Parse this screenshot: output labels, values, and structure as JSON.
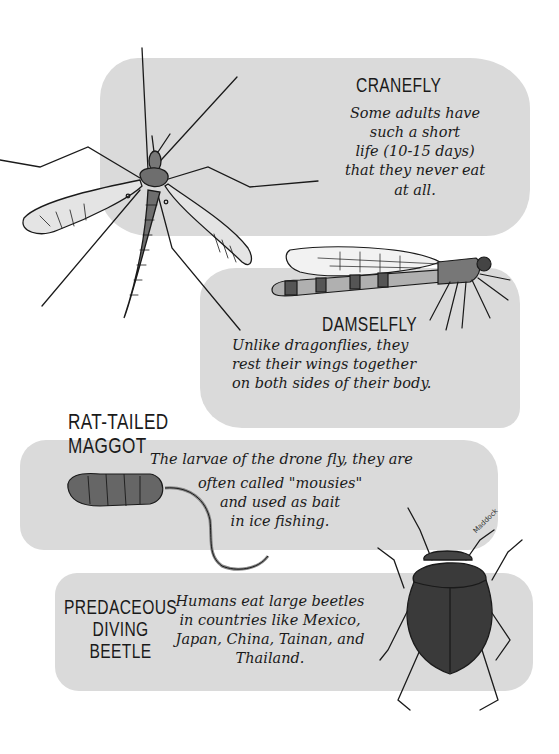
{
  "colors": {
    "background": "#ffffff",
    "patch": "#dadada",
    "ink": "#1a1a1a",
    "body_fill": "#6e6e6e",
    "beetle_fill": "#3a3a3a"
  },
  "entries": [
    {
      "name": "CRANEFLY",
      "text": "Some adults have\nsuch a short\nlife (10-15 days)\nthat they never eat\nat all."
    },
    {
      "name": "DAMSELFLY",
      "text": "Unlike dragonflies, they\nrest their wings together\non both sides of their body."
    },
    {
      "name": "RAT-TAILED\nMAGGOT",
      "text_line1": "The larvae of the drone fly, they are",
      "text_rest": "often called \"mousies\"\nand used as bait\nin ice fishing."
    },
    {
      "name": "PREDACEOUS\nDIVING\nBEETLE",
      "text": "Humans eat large beetles\nin countries like Mexico,\nJapan, China, Tainan, and\nThailand."
    }
  ],
  "illustrations": [
    "cranefly-icon",
    "damselfly-icon",
    "rat-tailed-maggot-icon",
    "diving-beetle-icon"
  ],
  "signature": "Maddock"
}
